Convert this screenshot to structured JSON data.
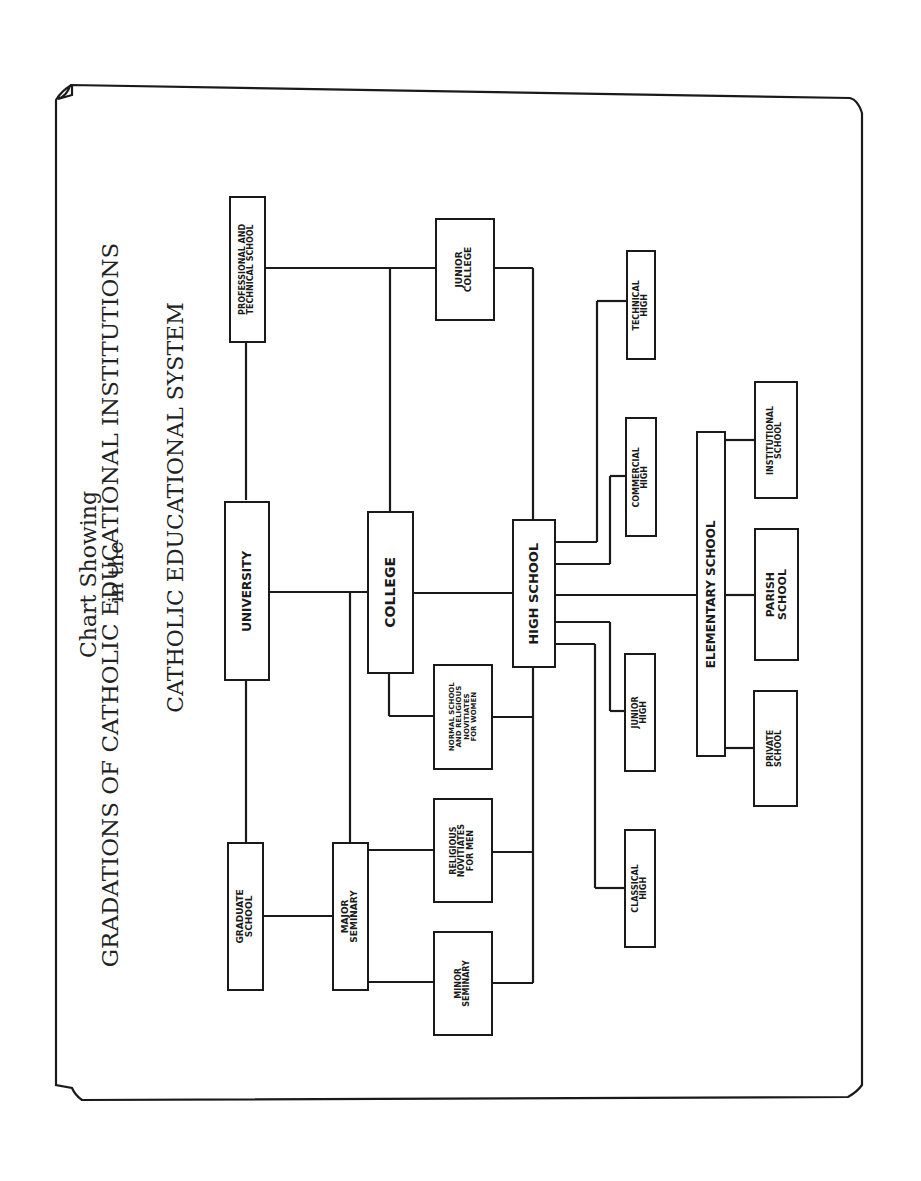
{
  "title": {
    "line1": "Chart Showing",
    "line2": "GRADATIONS OF CATHOLIC EDUCATIONAL INSTITUTIONS",
    "line3": "in the",
    "line4": "CATHOLIC EDUCATIONAL SYSTEM"
  },
  "nodes": {
    "professional": "PROFESSIONAL AND\nTECHNICAL SCHOOL",
    "junior_college": "JUNIOR\nCOLLEGE",
    "technical_high": "TECHNICAL\nHIGH",
    "commercial_high": "COMMERCIAL\nHIGH",
    "institutional": "INSTITUTIONAL\nSCHOOL",
    "university": "UNIVERSITY",
    "college": "COLLEGE",
    "high_school": "HIGH SCHOOL",
    "elementary": "ELEMENTARY SCHOOL",
    "parish": "PARISH\nSCHOOL",
    "normal_school": "NORMAL SCHOOL\nAND RELIGIOUS\nNOVITIATES\nFOR WOMEN",
    "junior_high": "JUNIOR\nHIGH",
    "private": "PRIVATE\nSCHOOL",
    "graduate": "GRADUATE\nSCHOOL",
    "major_seminary": "MAJOR\nSEMINARY",
    "religious_men": "RELIGIOUS\nNOVITIATES\nFOR MEN",
    "minor_seminary": "MINOR\nSEMINARY",
    "classical_high": "CLASSICAL\nHIGH"
  },
  "colors": {
    "ink": "#1a1a1a",
    "paper": "#ffffff"
  }
}
